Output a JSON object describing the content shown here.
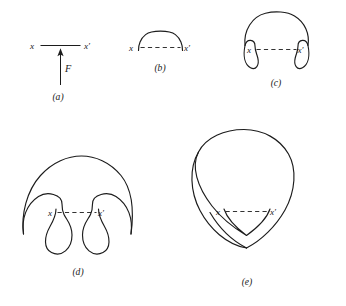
{
  "figure": {
    "background_color": "#ffffff",
    "stroke_color": "#1c1c1c",
    "dash_color": "#333333",
    "panels": [
      {
        "id": "a",
        "caption": "(a)",
        "left_label": "x",
        "right_label": "x′",
        "force_label": "F",
        "link_style": "solid",
        "description": "straight solid segment joining x and x-prime with an upward force arrow at its midpoint"
      },
      {
        "id": "b",
        "caption": "(b)",
        "left_label": "x",
        "right_label": "x′",
        "link_style": "dashed",
        "description": "small semicircular arc above the dashed segment joining x and x-prime"
      },
      {
        "id": "c",
        "caption": "(c)",
        "left_label": "x",
        "right_label": "x′",
        "link_style": "dashed",
        "description": "larger closed loop bulging above and below the dashed segment with inward hooks at the endpoints"
      },
      {
        "id": "d",
        "caption": "(d)",
        "left_label": "x",
        "right_label": "x′",
        "link_style": "dashed",
        "description": "still larger loop with two pendant lobes hanging below the dashed segment separated by a cleft"
      },
      {
        "id": "e",
        "caption": "(e)",
        "left_label": "x",
        "right_label": "x′",
        "link_style": "dashed",
        "description": "largest nearly circular loop with a small downward V-notch at the dashed segment and an upward cusp at the bottom"
      }
    ]
  }
}
